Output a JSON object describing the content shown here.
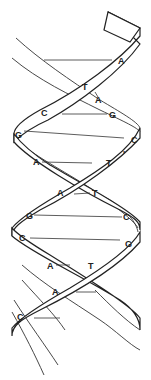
{
  "diagram": {
    "type": "dna-double-helix",
    "base_pairs": [
      {
        "left": "",
        "right": "A"
      },
      {
        "left": "T",
        "right": "A"
      },
      {
        "left": "C",
        "right": "G"
      },
      {
        "left": "G",
        "right": "C"
      },
      {
        "left": "A",
        "right": "T"
      },
      {
        "left": "A",
        "right": "T"
      },
      {
        "left": "G",
        "right": "C"
      },
      {
        "left": "C",
        "right": "G"
      },
      {
        "left": "A",
        "right": "T"
      },
      {
        "left": "A",
        "right": ""
      },
      {
        "left": "C",
        "right": ""
      }
    ],
    "labels": [
      {
        "text": "A",
        "x": 118,
        "y": 64
      },
      {
        "text": "T",
        "x": 82,
        "y": 90
      },
      {
        "text": "A",
        "x": 95,
        "y": 103
      },
      {
        "text": "C",
        "x": 41,
        "y": 116
      },
      {
        "text": "G",
        "x": 109,
        "y": 118
      },
      {
        "text": "G",
        "x": 15,
        "y": 138
      },
      {
        "text": "C",
        "x": 131,
        "y": 143
      },
      {
        "text": "A",
        "x": 33,
        "y": 165
      },
      {
        "text": "T",
        "x": 106,
        "y": 166
      },
      {
        "text": "'",
        "x": 123,
        "y": 157
      },
      {
        "text": "A",
        "x": 57,
        "y": 196
      },
      {
        "text": "T",
        "x": 92,
        "y": 196
      },
      {
        "text": "G",
        "x": 26,
        "y": 219
      },
      {
        "text": "C",
        "x": 123,
        "y": 220
      },
      {
        "text": "C",
        "x": 19,
        "y": 241
      },
      {
        "text": "G",
        "x": 125,
        "y": 247
      },
      {
        "text": "A",
        "x": 47,
        "y": 269
      },
      {
        "text": "T",
        "x": 88,
        "y": 269
      },
      {
        "text": "A",
        "x": 52,
        "y": 295
      },
      {
        "text": "C",
        "x": 17,
        "y": 320
      }
    ]
  }
}
